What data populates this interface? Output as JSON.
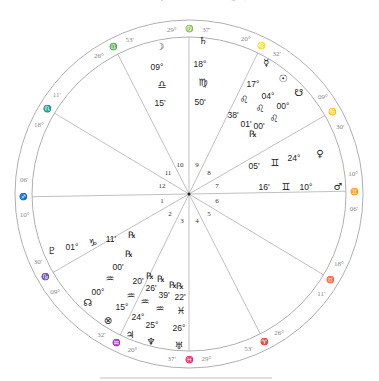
{
  "header": {
    "caption": "Natal Chart for July 1973 at 00:00 in Burlington, Vermont"
  },
  "chart": {
    "center": [
      189,
      194
    ],
    "outer_radius": 174,
    "inner_radius": 157,
    "line_color": "#b0b0b0",
    "text_color": "#222222",
    "cusp_text_color": "#888888"
  },
  "cusps": [
    {
      "house": 1,
      "angle": 181,
      "deg": "10°",
      "sign": "♐",
      "min": "06'"
    },
    {
      "house": 2,
      "angle": 210,
      "deg": "09°",
      "sign": "♑",
      "min": "30'"
    },
    {
      "house": 3,
      "angle": 244,
      "deg": "20°",
      "sign": "♒",
      "min": "32'"
    },
    {
      "house": 4,
      "angle": 270,
      "deg": "29°",
      "sign": "♓",
      "min": "37'"
    },
    {
      "house": 5,
      "angle": 297,
      "deg": "26°",
      "sign": "♈",
      "min": "53'"
    },
    {
      "house": 6,
      "angle": 329,
      "deg": "18°",
      "sign": "♉",
      "min": "11'"
    },
    {
      "house": 7,
      "angle": 1,
      "deg": "10°",
      "sign": "♊",
      "min": "06'"
    },
    {
      "house": 8,
      "angle": 30,
      "deg": "09°",
      "sign": "♋",
      "min": "30'"
    },
    {
      "house": 9,
      "angle": 64,
      "deg": "20°",
      "sign": "♌",
      "min": "32'"
    },
    {
      "house": 10,
      "angle": 90,
      "deg": "29°",
      "sign": "♍",
      "min": "37'"
    },
    {
      "house": 11,
      "angle": 117,
      "deg": "26°",
      "sign": "♎",
      "min": "53'"
    },
    {
      "house": 12,
      "angle": 149,
      "deg": "18°",
      "sign": "♏",
      "min": "11'"
    }
  ],
  "house_numbers": [
    {
      "n": "1",
      "x": 162,
      "y": 203
    },
    {
      "n": "2",
      "x": 170,
      "y": 216
    },
    {
      "n": "3",
      "x": 182,
      "y": 223
    },
    {
      "n": "4",
      "x": 197,
      "y": 223
    },
    {
      "n": "5",
      "x": 209,
      "y": 216
    },
    {
      "n": "6",
      "x": 217,
      "y": 203
    },
    {
      "n": "7",
      "x": 217,
      "y": 188
    },
    {
      "n": "8",
      "x": 209,
      "y": 175
    },
    {
      "n": "9",
      "x": 197,
      "y": 167
    },
    {
      "n": "10",
      "x": 180,
      "y": 167
    },
    {
      "n": "11",
      "x": 168,
      "y": 175
    },
    {
      "n": "12",
      "x": 162,
      "y": 188
    }
  ],
  "planets": [
    {
      "name": "Moon",
      "glyph": "☽",
      "gx": 160,
      "gy": 50,
      "deg": "09°",
      "dx": 157,
      "dy": 70,
      "sign": "♎",
      "sx": 162,
      "sy": 88,
      "min": "15'",
      "mx": 160,
      "my": 106,
      "retro": ""
    },
    {
      "name": "Saturn",
      "glyph": "♄",
      "gx": 203,
      "gy": 44,
      "deg": "18°",
      "dx": 200,
      "dy": 67,
      "sign": "♍",
      "sx": 203,
      "sy": 86,
      "min": "50'",
      "mx": 200,
      "my": 105,
      "retro": ""
    },
    {
      "name": "Mercury",
      "glyph": "☿",
      "gx": 266,
      "gy": 66,
      "deg": "17°",
      "dx": 253,
      "dy": 87,
      "sign": "♌",
      "sx": 244,
      "sy": 103,
      "min": "38'",
      "mx": 233,
      "my": 118,
      "retro": ""
    },
    {
      "name": "Sun",
      "glyph": "☉",
      "gx": 283,
      "gy": 82,
      "deg": "04°",
      "dx": 268,
      "dy": 99,
      "sign": "♌",
      "sx": 260,
      "sy": 112,
      "min": "01'",
      "mx": 246,
      "my": 127,
      "retro": "℞",
      "rx": 253,
      "ry": 137
    },
    {
      "name": "North/South Node",
      "glyph": "☋",
      "gx": 299,
      "gy": 96,
      "deg": "00°",
      "dx": 283,
      "dy": 109,
      "sign": "♌",
      "sx": 274,
      "sy": 122,
      "min": "00'",
      "mx": 259,
      "my": 129,
      "retro": ""
    },
    {
      "name": "Venus",
      "glyph": "♀",
      "gx": 320,
      "gy": 157,
      "deg": "24°",
      "dx": 294,
      "dy": 161,
      "sign": "♊",
      "sx": 275,
      "sy": 166,
      "min": "05'",
      "mx": 254,
      "my": 169,
      "retro": ""
    },
    {
      "name": "Mars",
      "glyph": "♂",
      "gx": 338,
      "gy": 190,
      "deg": "10°",
      "dx": 306,
      "dy": 190,
      "sign": "♊",
      "sx": 286,
      "sy": 190,
      "min": "16'",
      "mx": 264,
      "my": 190,
      "retro": ""
    },
    {
      "name": "Pluto",
      "glyph": "♇",
      "gx": 52,
      "gy": 254,
      "deg": "01°",
      "dx": 72,
      "dy": 250,
      "sign": "♑",
      "sx": 93,
      "sy": 246,
      "min": "11'",
      "mx": 111,
      "my": 242,
      "retro": "℞",
      "rx": 132,
      "ry": 238
    },
    {
      "name": "North Node",
      "glyph": "☊",
      "gx": 88,
      "gy": 306,
      "deg": "00°",
      "dx": 98,
      "dy": 295,
      "sign": "♒",
      "sx": 110,
      "sy": 282,
      "min": "00'",
      "mx": 118,
      "my": 270,
      "retro": "℞",
      "rx": 129,
      "ry": 257
    },
    {
      "name": "Part of Fortune",
      "glyph": "⊗",
      "gx": 108,
      "gy": 324,
      "deg": "15°",
      "dx": 122,
      "dy": 310,
      "sign": "♒",
      "sx": 131,
      "sy": 299,
      "min": "20'",
      "mx": 138,
      "my": 284,
      "retro": "℞",
      "rx": 150,
      "ry": 279
    },
    {
      "name": "Jupiter",
      "glyph": "♃",
      "gx": 130,
      "gy": 338,
      "deg": "24°",
      "dx": 138,
      "dy": 320,
      "sign": "♒",
      "sx": 145,
      "sy": 305,
      "min": "26'",
      "mx": 151,
      "my": 291,
      "retro": "℞",
      "rx": 161,
      "ry": 282
    },
    {
      "name": "Neptune",
      "glyph": "♆",
      "gx": 151,
      "gy": 345,
      "deg": "25°",
      "dx": 152,
      "dy": 328,
      "sign": "♒",
      "sx": 160,
      "sy": 312,
      "min": "39'",
      "mx": 164,
      "my": 298,
      "retro": "℞",
      "rx": 173,
      "ry": 288
    },
    {
      "name": "Uranus",
      "glyph": "♅",
      "gx": 179,
      "gy": 349,
      "deg": "26°",
      "dx": 179,
      "dy": 331,
      "sign": "♓",
      "sx": 181,
      "sy": 314,
      "min": "22'",
      "mx": 180,
      "my": 300,
      "retro": "℞",
      "rx": 180,
      "ry": 289
    }
  ],
  "footer_rule": {
    "x1": 100,
    "x2": 272,
    "y": 378
  }
}
